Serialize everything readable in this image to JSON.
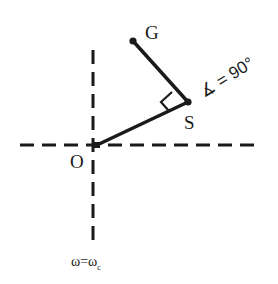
{
  "diagram": {
    "type": "phasor-geometry",
    "colors": {
      "stroke": "#1a1a1a",
      "background": "#ffffff"
    },
    "points": {
      "G": {
        "label": "G",
        "x": 133,
        "y": 41
      },
      "S": {
        "label": "S",
        "x": 188,
        "y": 102
      },
      "O": {
        "label": "O",
        "x": 97,
        "y": 145
      }
    },
    "axes": {
      "horizontal": {
        "style": "dashed",
        "y": 145,
        "x1": 20,
        "x2": 256
      },
      "vertical": {
        "style": "dashed",
        "x": 93,
        "y1": 50,
        "y2": 243
      }
    },
    "segments": [
      {
        "from": "O",
        "to": "S",
        "style": "solid"
      },
      {
        "from": "S",
        "to": "G",
        "style": "solid"
      }
    ],
    "right_angle_marker": {
      "at": "S"
    },
    "labels": {
      "G": "G",
      "S": "S",
      "O": "O",
      "angle_annotation": "∡ = 90°",
      "axis_condition_main": "ω=ω",
      "axis_condition_sub": "c"
    }
  }
}
